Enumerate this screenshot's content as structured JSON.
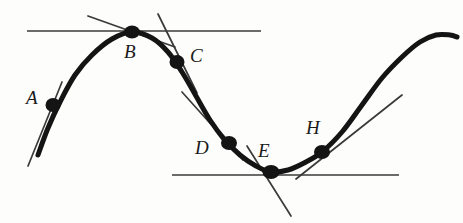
{
  "figure": {
    "background_color": "#fdfdfc",
    "ink_color": "#141414",
    "line_color": "#3a3a3a",
    "width": 463,
    "height": 223
  },
  "chart_data": {
    "type": "line",
    "xlabel": "",
    "ylabel": "",
    "grid": false,
    "legend": null,
    "xlim": [
      0,
      463
    ],
    "ylim": [
      223,
      0
    ],
    "curve": {
      "name": "main-curve",
      "stroke_width": 5,
      "points": [
        [
          38,
          155
        ],
        [
          48,
          128
        ],
        [
          60,
          102
        ],
        [
          75,
          75
        ],
        [
          92,
          55
        ],
        [
          112,
          39
        ],
        [
          132,
          32
        ],
        [
          152,
          38
        ],
        [
          168,
          52
        ],
        [
          182,
          72
        ],
        [
          196,
          96
        ],
        [
          210,
          120
        ],
        [
          224,
          139
        ],
        [
          240,
          155
        ],
        [
          256,
          166
        ],
        [
          271,
          172
        ],
        [
          288,
          170
        ],
        [
          304,
          163
        ],
        [
          322,
          152
        ],
        [
          342,
          132
        ],
        [
          362,
          105
        ],
        [
          382,
          78
        ],
        [
          402,
          57
        ],
        [
          420,
          42
        ],
        [
          436,
          35
        ],
        [
          450,
          35
        ],
        [
          457,
          37
        ]
      ]
    },
    "reference_lines": [
      {
        "name": "upper-horizontal-line",
        "x1": 27,
        "y1": 31,
        "x2": 261,
        "y2": 31,
        "stroke_width": 1.6
      },
      {
        "name": "lower-horizontal-line",
        "x1": 172,
        "y1": 175,
        "x2": 399,
        "y2": 175,
        "stroke_width": 1.6
      }
    ],
    "points": [
      {
        "label": "A",
        "x": 53,
        "y": 105,
        "label_x": 26,
        "label_y": 88,
        "dot_rx": 7.5,
        "dot_ry": 7,
        "tangent": {
          "x1": 62,
          "y1": 82,
          "x2": 28,
          "y2": 166,
          "stroke_width": 1.7
        }
      },
      {
        "label": "B",
        "x": 132,
        "y": 32,
        "label_x": 124,
        "label_y": 42,
        "dot_rx": 8,
        "dot_ry": 6.5,
        "tangent": {
          "x1": 88,
          "y1": 16,
          "x2": 175,
          "y2": 47,
          "stroke_width": 1.7
        }
      },
      {
        "label": "C",
        "x": 177,
        "y": 62,
        "label_x": 190,
        "label_y": 46,
        "dot_rx": 7.5,
        "dot_ry": 7,
        "tangent": {
          "x1": 158,
          "y1": 14,
          "x2": 197,
          "y2": 93,
          "stroke_width": 1.7
        }
      },
      {
        "label": "D",
        "x": 229,
        "y": 143,
        "label_x": 195,
        "label_y": 138,
        "dot_rx": 8,
        "dot_ry": 7,
        "tangent": {
          "x1": 182,
          "y1": 92,
          "x2": 243,
          "y2": 160,
          "stroke_width": 1.7
        }
      },
      {
        "label": "E",
        "x": 271,
        "y": 172,
        "label_x": 258,
        "label_y": 141,
        "dot_rx": 8.5,
        "dot_ry": 7,
        "tangent": {
          "x1": 247,
          "y1": 146,
          "x2": 291,
          "y2": 216,
          "stroke_width": 1.7
        }
      },
      {
        "label": "H",
        "x": 322,
        "y": 152,
        "label_x": 306,
        "label_y": 118,
        "dot_rx": 8,
        "dot_ry": 7,
        "tangent": {
          "x1": 296,
          "y1": 179,
          "x2": 402,
          "y2": 95,
          "stroke_width": 1.7
        }
      }
    ],
    "labels": [
      "A",
      "B",
      "C",
      "D",
      "E",
      "H"
    ]
  }
}
